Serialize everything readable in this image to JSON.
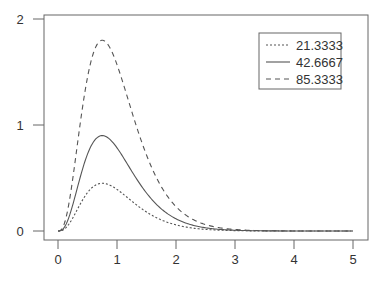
{
  "chart_data": {
    "type": "line",
    "title": "",
    "xlabel": "",
    "ylabel": "",
    "xlim": [
      0,
      5
    ],
    "ylim": [
      0,
      2
    ],
    "grid": false,
    "legend_position": "top-right",
    "x_ticks": [
      "0",
      "1",
      "2",
      "3",
      "4",
      "5"
    ],
    "y_ticks": [
      "0",
      "1",
      "2"
    ],
    "x": [
      0,
      0.25,
      0.5,
      0.75,
      1.0,
      1.25,
      1.5,
      1.75,
      2.0,
      2.5,
      3.0,
      3.5,
      4.0,
      4.5,
      5.0
    ],
    "series": [
      {
        "name": "21.3333",
        "style": "dotted",
        "values": [
          0,
          0.08,
          0.32,
          0.45,
          0.39,
          0.27,
          0.17,
          0.1,
          0.06,
          0.02,
          0.004,
          0.001,
          0,
          0,
          0
        ]
      },
      {
        "name": "42.6667",
        "style": "solid",
        "values": [
          0,
          0.16,
          0.64,
          0.9,
          0.79,
          0.55,
          0.35,
          0.2,
          0.12,
          0.04,
          0.01,
          0.002,
          0,
          0,
          0
        ]
      },
      {
        "name": "85.3333",
        "style": "dashed",
        "values": [
          0,
          0.32,
          1.28,
          1.8,
          1.57,
          1.1,
          0.7,
          0.4,
          0.24,
          0.07,
          0.02,
          0.004,
          0.001,
          0,
          0
        ]
      }
    ]
  },
  "legend": {
    "items": [
      "21.3333",
      "42.6667",
      "85.3333"
    ]
  }
}
